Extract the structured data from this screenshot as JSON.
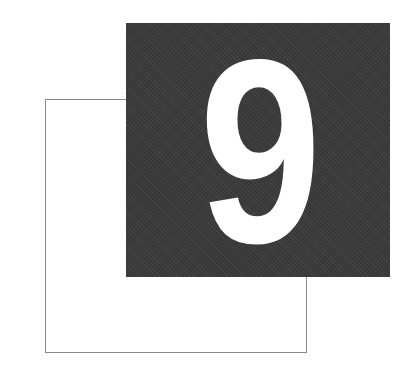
{
  "chapter": {
    "number": "9"
  },
  "colors": {
    "dark_square": "#3a3a3a",
    "outline": "#8a8a8a",
    "numeral": "#ffffff",
    "background": "#ffffff"
  }
}
